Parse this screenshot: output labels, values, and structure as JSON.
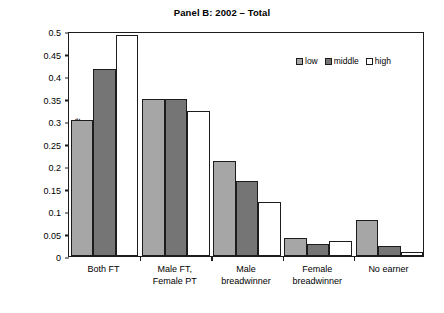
{
  "chart_data": {
    "type": "bar",
    "title": "Panel B: 2002 – Total",
    "xlabel": "",
    "ylabel": "Share",
    "ylim": [
      0,
      0.5
    ],
    "yticks": [
      "0",
      "0.05",
      "0.1",
      "0.15",
      "0.2",
      "0.25",
      "0.3",
      "0.35",
      "0.4",
      "0.45",
      "0.5"
    ],
    "ytick_values": [
      0,
      0.05,
      0.1,
      0.15,
      0.2,
      0.25,
      0.3,
      0.35,
      0.4,
      0.45,
      0.5
    ],
    "grid": false,
    "legend_position": "top-right",
    "categories": [
      "Both FT",
      "Male FT,\nFemale PT",
      "Male\nbreadwinner",
      "Female\nbreadwinner",
      "No earner"
    ],
    "series": [
      {
        "name": "low",
        "color": "#a6a6a6",
        "values": [
          0.303,
          0.35,
          0.211,
          0.039,
          0.079
        ]
      },
      {
        "name": "middle",
        "color": "#757575",
        "values": [
          0.415,
          0.348,
          0.167,
          0.027,
          0.022
        ]
      },
      {
        "name": "high",
        "color": "#ffffff",
        "values": [
          0.491,
          0.322,
          0.121,
          0.033,
          0.008
        ]
      }
    ]
  },
  "legend": {
    "items": [
      {
        "label": "low"
      },
      {
        "label": "middle"
      },
      {
        "label": "high"
      }
    ]
  }
}
